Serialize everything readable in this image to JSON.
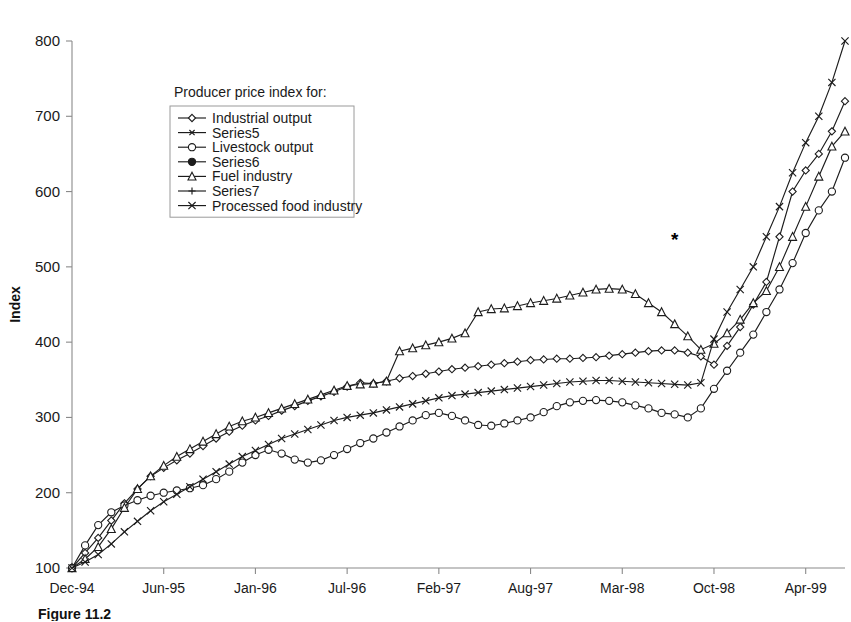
{
  "caption": "Figure 11.2",
  "chart_data": {
    "type": "line",
    "title": "",
    "xlabel": "",
    "ylabel": "Index",
    "ylim": [
      100,
      800
    ],
    "ytick_values": [
      100,
      200,
      300,
      400,
      500,
      600,
      700,
      800
    ],
    "grid": false,
    "legend_position": "upper-left-inside",
    "legend_title": "Producer price index for:",
    "annotations": [
      {
        "text": "*",
        "x_index": 46,
        "y_value": 528
      }
    ],
    "x_tick_labels": [
      "Dec-94",
      "Jun-95",
      "Jan-96",
      "Jul-96",
      "Feb-97",
      "Aug-97",
      "Mar-98",
      "Oct-98",
      "Apr-99"
    ],
    "x_tick_indices": [
      0,
      7,
      14,
      21,
      28,
      35,
      42,
      49,
      56
    ],
    "n_points": 60,
    "series": [
      {
        "name": "Industrial output",
        "marker": "diamond",
        "values": [
          100,
          120,
          140,
          163,
          186,
          205,
          222,
          233,
          243,
          252,
          262,
          272,
          281,
          289,
          296,
          302,
          309,
          315,
          322,
          328,
          334,
          341,
          346,
          345,
          348,
          352,
          355,
          358,
          361,
          364,
          366,
          368,
          370,
          372,
          374,
          376,
          377,
          378,
          378,
          379,
          380,
          382,
          384,
          386,
          388,
          389,
          389,
          386,
          381,
          370,
          395,
          420,
          450,
          480,
          540,
          600,
          628,
          650,
          680,
          720
        ]
      },
      {
        "name": "Series5",
        "marker": "x-small",
        "values": []
      },
      {
        "name": "Livestock output",
        "marker": "circle",
        "values": [
          100,
          130,
          157,
          174,
          183,
          190,
          196,
          200,
          203,
          206,
          210,
          218,
          228,
          240,
          250,
          257,
          252,
          244,
          240,
          243,
          250,
          258,
          266,
          272,
          280,
          288,
          296,
          303,
          306,
          302,
          296,
          290,
          289,
          292,
          296,
          300,
          307,
          315,
          320,
          322,
          323,
          322,
          320,
          316,
          312,
          306,
          304,
          300,
          312,
          338,
          362,
          386,
          410,
          440,
          470,
          505,
          545,
          575,
          600,
          645
        ]
      },
      {
        "name": "Series6",
        "marker": "circle-filled",
        "values": []
      },
      {
        "name": "Fuel industry",
        "marker": "triangle",
        "values": [
          100,
          112,
          128,
          152,
          180,
          205,
          222,
          236,
          248,
          258,
          268,
          278,
          288,
          295,
          300,
          306,
          312,
          318,
          324,
          330,
          336,
          342,
          344,
          345,
          348,
          388,
          392,
          396,
          400,
          405,
          412,
          440,
          444,
          445,
          448,
          452,
          455,
          458,
          462,
          466,
          470,
          471,
          470,
          464,
          452,
          440,
          424,
          408,
          390,
          398,
          412,
          430,
          452,
          468,
          500,
          540,
          580,
          620,
          660,
          680
        ]
      },
      {
        "name": "Series7",
        "marker": "plus",
        "values": []
      },
      {
        "name": "Processed food industry",
        "marker": "x-cross",
        "values": [
          100,
          108,
          118,
          132,
          148,
          162,
          176,
          188,
          198,
          208,
          218,
          228,
          238,
          248,
          256,
          264,
          272,
          278,
          284,
          290,
          296,
          300,
          303,
          306,
          310,
          314,
          318,
          322,
          326,
          329,
          331,
          333,
          335,
          337,
          339,
          341,
          343,
          345,
          347,
          348,
          349,
          349,
          348,
          347,
          346,
          345,
          344,
          343,
          346,
          404,
          440,
          470,
          500,
          540,
          580,
          625,
          665,
          700,
          745,
          800
        ]
      }
    ]
  }
}
